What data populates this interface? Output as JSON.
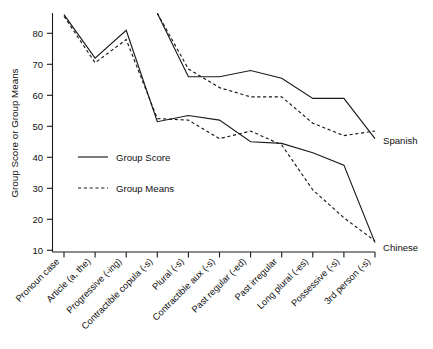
{
  "chart_data": {
    "type": "line",
    "title": "",
    "xlabel": "",
    "ylabel": "Group Score or Group Means",
    "ylim": [
      10,
      86
    ],
    "yticks": [
      10,
      20,
      30,
      40,
      50,
      60,
      70,
      80
    ],
    "grid": false,
    "legend_position": "inner-left",
    "categories": [
      "Pronoun case",
      "Article (a, the)",
      "Progressive (-ing)",
      "Contractible copula (-s)",
      "Plural (-s)",
      "Contractible aux (-s)",
      "Past regular (-ed)",
      "Past irregular",
      "Long plural (-es)",
      "Possessive (-s)",
      "3rd person (-s)"
    ],
    "series": [
      {
        "name": "Chinese Group Score",
        "group": "Chinese",
        "style": "solid",
        "values": [
          86.0,
          72.0,
          81.0,
          51.5,
          53.5,
          52.0,
          45.0,
          44.5,
          41.5,
          37.5,
          12.5
        ]
      },
      {
        "name": "Chinese Group Means",
        "group": "Chinese",
        "style": "dashed",
        "values": [
          85.5,
          70.5,
          78.0,
          52.5,
          52.0,
          46.0,
          48.5,
          44.0,
          29.5,
          20.5,
          13.0
        ]
      },
      {
        "name": "Spanish Group Score",
        "group": "Spanish",
        "style": "solid",
        "values": [
          null,
          null,
          null,
          86.5,
          66.0,
          66.0,
          68.0,
          65.5,
          59.0,
          59.0,
          46.0
        ]
      },
      {
        "name": "Spanish Group Means",
        "group": "Spanish",
        "style": "dashed",
        "values": [
          null,
          null,
          null,
          86.5,
          68.5,
          62.5,
          59.5,
          59.5,
          51.0,
          47.0,
          48.5
        ]
      }
    ],
    "annotations": [
      {
        "name": "spanish-group-label",
        "text": "Spanish"
      },
      {
        "name": "chinese-group-label",
        "text": "Chinese"
      }
    ],
    "legend": [
      {
        "label": "Group Score",
        "style": "solid"
      },
      {
        "label": "Group Means",
        "style": "dashed"
      }
    ],
    "axis": {
      "y_title": "Group Score or Group Means",
      "y_tick_labels": [
        "80",
        "70",
        "60",
        "50",
        "40",
        "30",
        "20",
        "10"
      ]
    }
  }
}
